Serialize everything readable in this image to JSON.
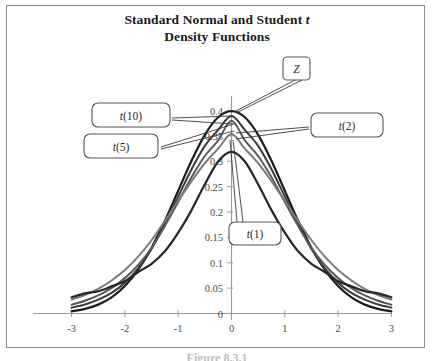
{
  "figure": {
    "title_line1_prefix": "Standard Normal and Student ",
    "title_line1_italic": "t",
    "title_line2": "Density Functions",
    "caption": "Figure 8.3.1"
  },
  "chart_data": {
    "type": "line",
    "title": "Standard Normal and Student t Density Functions",
    "xlabel": "",
    "ylabel": "",
    "xlim": [
      -3,
      3
    ],
    "ylim": [
      0,
      0.4
    ],
    "xticks": [
      -3,
      -2,
      -1,
      0,
      1,
      2,
      3
    ],
    "xtick_labels": [
      "-3",
      "-2",
      "-1",
      "0",
      "1",
      "2",
      "3"
    ],
    "yticks": [
      0,
      0.05,
      0.1,
      0.15,
      0.2,
      0.25,
      0.3,
      0.35,
      0.4
    ],
    "ytick_labels": [
      "0",
      "0.05",
      "0.1",
      "0.15",
      "0.2",
      "0.25",
      "0.3",
      "0.35",
      "0.4"
    ],
    "grid": false,
    "legend": "callout-labels",
    "x": [
      -3,
      -2.75,
      -2.5,
      -2.25,
      -2,
      -1.75,
      -1.5,
      -1.25,
      -1,
      -0.75,
      -0.5,
      -0.25,
      0,
      0.25,
      0.5,
      0.75,
      1,
      1.25,
      1.5,
      1.75,
      2,
      2.25,
      2.5,
      2.75,
      3
    ],
    "series": [
      {
        "name": "Z",
        "label": "Z",
        "peak": 0.399,
        "color": "#1c1c1c",
        "width": 2.2,
        "values": [
          0.0044,
          0.0091,
          0.0175,
          0.0317,
          0.054,
          0.0863,
          0.1295,
          0.1826,
          0.242,
          0.3011,
          0.3521,
          0.3867,
          0.3989,
          0.3867,
          0.3521,
          0.3011,
          0.242,
          0.1826,
          0.1295,
          0.0863,
          0.054,
          0.0317,
          0.0175,
          0.0091,
          0.0044
        ]
      },
      {
        "name": "t(10)",
        "label": "t(10)",
        "peak": 0.389,
        "color": "#3a3a3a",
        "width": 2.0,
        "values": [
          0.0114,
          0.0178,
          0.0272,
          0.0406,
          0.0607,
          0.0889,
          0.1272,
          0.1761,
          0.2304,
          0.2842,
          0.3303,
          0.3619,
          0.3891,
          0.3619,
          0.3303,
          0.2842,
          0.2304,
          0.1761,
          0.1272,
          0.0889,
          0.0607,
          0.0406,
          0.0272,
          0.0178,
          0.0114
        ]
      },
      {
        "name": "t(5)",
        "label": "t(5)",
        "peak": 0.3796,
        "color": "#5a5a5a",
        "width": 2.0,
        "values": [
          0.0173,
          0.025,
          0.0356,
          0.0501,
          0.0697,
          0.0955,
          0.1295,
          0.1725,
          0.2197,
          0.2683,
          0.3103,
          0.3412,
          0.3796,
          0.3412,
          0.3103,
          0.2683,
          0.2197,
          0.1725,
          0.1295,
          0.0955,
          0.0697,
          0.0501,
          0.0356,
          0.025,
          0.0173
        ]
      },
      {
        "name": "t(2)",
        "label": "t(2)",
        "peak": 0.3536,
        "color": "#7a7a7a",
        "width": 2.0,
        "values": [
          0.0274,
          0.0365,
          0.0487,
          0.0651,
          0.0858,
          0.1122,
          0.1443,
          0.1824,
          0.2222,
          0.2605,
          0.2962,
          0.3248,
          0.3536,
          0.3248,
          0.2962,
          0.2605,
          0.2222,
          0.1824,
          0.1443,
          0.1122,
          0.0858,
          0.0651,
          0.0487,
          0.0365,
          0.0274
        ]
      },
      {
        "name": "t(1)",
        "label": "t(1)",
        "peak": 0.3183,
        "color": "#262626",
        "width": 2.2,
        "values": [
          0.0318,
          0.0396,
          0.0439,
          0.0535,
          0.0637,
          0.0818,
          0.0979,
          0.1225,
          0.1592,
          0.2037,
          0.2546,
          0.2995,
          0.3183,
          0.2995,
          0.2546,
          0.2037,
          0.1592,
          0.1225,
          0.0979,
          0.0818,
          0.0637,
          0.0535,
          0.0439,
          0.0396,
          0.0318
        ]
      }
    ],
    "annotations": [
      {
        "id": "z",
        "label": "Z",
        "target_x": 0.0,
        "target_y": 0.399
      },
      {
        "id": "t10",
        "label": "t(10)",
        "target_x": 0.02,
        "target_y": 0.389
      },
      {
        "id": "t5",
        "label": "t(5)",
        "target_x": 0.04,
        "target_y": 0.372
      },
      {
        "id": "t2",
        "label": "t(2)",
        "target_x": 0.02,
        "target_y": 0.354
      },
      {
        "id": "t1",
        "label": "t(1)",
        "target_x": 0.06,
        "target_y": 0.318
      }
    ]
  }
}
